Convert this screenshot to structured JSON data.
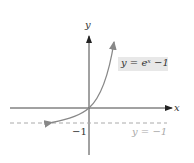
{
  "figure": {
    "equation_label": "y = eˣ −1",
    "asymptote_label": "y = −1",
    "x_axis_label": "x",
    "y_axis_label": "y",
    "tick_label": "−1"
  },
  "colors": {
    "curve": "#888888",
    "axes": "#333333",
    "asymptote": "#aaaaaa",
    "label_box": "#e8e8e8"
  }
}
